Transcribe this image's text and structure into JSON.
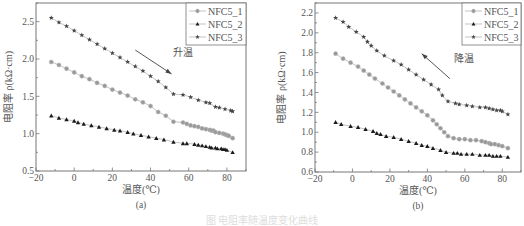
{
  "figure_caption": "图 电阻率随温度变化曲线",
  "chart_data": [
    {
      "type": "line",
      "panel_label": "(a)",
      "title": "",
      "xlabel": "温度(℃)",
      "ylabel": "电阻率 ρ(kΩ·cm)",
      "xlim": [
        -20,
        90
      ],
      "ylim": [
        0.5,
        2.75
      ],
      "xticks": [
        -20,
        0,
        20,
        40,
        60,
        80
      ],
      "yticks": [
        0.5,
        1.0,
        1.5,
        2.0,
        2.5
      ],
      "ytick_labels": [
        "0.5",
        "1.0",
        "1.5",
        "2.0",
        "2.5"
      ],
      "grid": false,
      "legend_position": "upper right",
      "annotation": {
        "text": "升温",
        "arrow_from": [
          32,
          2.12
        ],
        "arrow_to": [
          51,
          1.8
        ]
      },
      "series": [
        {
          "name": "NFC5_1",
          "marker": "circle",
          "color": "#999999",
          "x": [
            -12,
            -8,
            -4,
            0,
            4,
            8,
            12,
            16,
            20,
            24,
            28,
            32,
            36,
            40,
            44,
            48,
            52,
            57,
            59,
            61,
            63,
            65,
            67,
            69,
            71,
            72,
            73,
            74,
            76,
            78,
            79,
            80,
            81,
            83
          ],
          "y": [
            1.96,
            1.92,
            1.87,
            1.82,
            1.77,
            1.73,
            1.68,
            1.64,
            1.59,
            1.55,
            1.51,
            1.46,
            1.42,
            1.37,
            1.29,
            1.24,
            1.16,
            1.15,
            1.13,
            1.11,
            1.1,
            1.09,
            1.07,
            1.06,
            1.05,
            1.04,
            1.04,
            1.02,
            1.01,
            1.0,
            0.99,
            0.98,
            0.97,
            0.94
          ]
        },
        {
          "name": "NFC5_2",
          "marker": "triangle",
          "color": "#1a1a1a",
          "x": [
            -12,
            -8,
            -4,
            0,
            2,
            5,
            9,
            13,
            17,
            21,
            24,
            28,
            31,
            35,
            39,
            43,
            47,
            52,
            57,
            59,
            63,
            65,
            67,
            69,
            71,
            72,
            74,
            75,
            77,
            78,
            79,
            80,
            83
          ],
          "y": [
            1.24,
            1.21,
            1.19,
            1.17,
            1.15,
            1.13,
            1.11,
            1.09,
            1.07,
            1.05,
            1.04,
            1.02,
            1.0,
            0.98,
            0.96,
            0.94,
            0.92,
            0.89,
            0.87,
            0.87,
            0.86,
            0.85,
            0.84,
            0.83,
            0.82,
            0.81,
            0.81,
            0.8,
            0.8,
            0.79,
            0.79,
            0.78,
            0.75
          ]
        },
        {
          "name": "NFC5_3",
          "marker": "star",
          "color": "#444444",
          "x": [
            -12,
            -8,
            -4,
            0,
            4,
            8,
            12,
            16,
            20,
            24,
            28,
            32,
            36,
            40,
            44,
            48,
            52,
            57,
            61,
            65,
            69,
            71,
            74,
            76,
            79,
            82,
            83
          ],
          "y": [
            2.55,
            2.49,
            2.44,
            2.38,
            2.32,
            2.26,
            2.2,
            2.14,
            2.08,
            2.02,
            1.96,
            1.9,
            1.84,
            1.77,
            1.7,
            1.62,
            1.53,
            1.52,
            1.49,
            1.45,
            1.42,
            1.41,
            1.36,
            1.35,
            1.33,
            1.31,
            1.3
          ]
        }
      ]
    },
    {
      "type": "line",
      "panel_label": "(b)",
      "title": "",
      "xlabel": "温度(℃)",
      "ylabel": "电阻率 ρ(kΩ·cm)",
      "xlim": [
        -20,
        90
      ],
      "ylim": [
        0.6,
        2.3
      ],
      "xticks": [
        -20,
        0,
        20,
        40,
        60,
        80
      ],
      "yticks": [
        0.6,
        0.8,
        1.0,
        1.2,
        1.4,
        1.6,
        1.8,
        2.0,
        2.2
      ],
      "ytick_labels": [
        "0.6",
        "0.8",
        "1.0",
        "1.2",
        "1.4",
        "1.6",
        "1.8",
        "2.0",
        "2.2"
      ],
      "grid": false,
      "legend_position": "upper right",
      "annotation": {
        "text": "降温",
        "arrow_from": [
          52,
          1.54
        ],
        "arrow_to": [
          37,
          1.79
        ]
      },
      "series": [
        {
          "name": "NFC5_1",
          "marker": "circle",
          "color": "#999999",
          "x": [
            -9,
            -5,
            -1,
            3,
            6,
            9,
            12,
            16,
            19,
            22,
            25,
            28,
            31,
            34,
            37,
            40,
            43,
            45,
            47,
            49,
            51,
            54,
            57,
            60,
            63,
            66,
            69,
            71,
            73,
            74,
            76,
            78,
            80,
            83
          ],
          "y": [
            1.79,
            1.74,
            1.7,
            1.66,
            1.62,
            1.58,
            1.54,
            1.49,
            1.45,
            1.41,
            1.37,
            1.33,
            1.29,
            1.25,
            1.21,
            1.17,
            1.12,
            1.08,
            1.04,
            1.0,
            0.96,
            0.94,
            0.93,
            0.93,
            0.92,
            0.92,
            0.91,
            0.9,
            0.89,
            0.88,
            0.88,
            0.87,
            0.86,
            0.84
          ]
        },
        {
          "name": "NFC5_2",
          "marker": "triangle",
          "color": "#1a1a1a",
          "x": [
            -9,
            -6,
            -1,
            3,
            7,
            11,
            13,
            15,
            18,
            22,
            26,
            30,
            34,
            37,
            40,
            43,
            47,
            50,
            54,
            56,
            58,
            61,
            64,
            68,
            71,
            73,
            75,
            77,
            79,
            83
          ],
          "y": [
            1.1,
            1.08,
            1.06,
            1.05,
            1.03,
            1.01,
            0.99,
            0.98,
            0.96,
            0.95,
            0.93,
            0.91,
            0.89,
            0.87,
            0.86,
            0.84,
            0.82,
            0.8,
            0.79,
            0.79,
            0.78,
            0.78,
            0.78,
            0.77,
            0.77,
            0.77,
            0.76,
            0.76,
            0.76,
            0.75
          ]
        },
        {
          "name": "NFC5_3",
          "marker": "star",
          "color": "#444444",
          "x": [
            -9,
            -5,
            -2,
            2,
            6,
            8,
            10,
            13,
            17,
            22,
            26,
            30,
            34,
            38,
            42,
            46,
            48,
            51,
            55,
            57,
            61,
            64,
            68,
            71,
            73,
            75,
            77,
            79,
            80,
            83
          ],
          "y": [
            2.15,
            2.11,
            2.06,
            2.01,
            1.96,
            1.91,
            1.87,
            1.82,
            1.77,
            1.72,
            1.68,
            1.63,
            1.58,
            1.53,
            1.48,
            1.43,
            1.37,
            1.31,
            1.29,
            1.28,
            1.27,
            1.26,
            1.25,
            1.25,
            1.24,
            1.23,
            1.22,
            1.22,
            1.21,
            1.18
          ]
        }
      ]
    }
  ]
}
